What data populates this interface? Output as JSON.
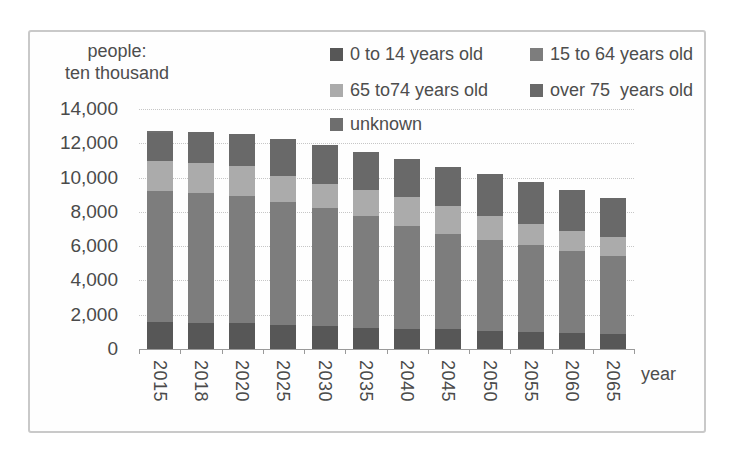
{
  "axis": {
    "y_title_line1": "people:",
    "y_title_line2": "ten thousand",
    "x_title": "year"
  },
  "chart_data": {
    "type": "bar",
    "stacked": true,
    "title": "",
    "ylabel": "people: ten thousand",
    "xlabel": "year",
    "ylim": [
      0,
      14000
    ],
    "ytick_interval": 2000,
    "ytick_labels": [
      "0",
      "2,000",
      "4,000",
      "6,000",
      "8,000",
      "10,000",
      "12,000",
      "14,000"
    ],
    "grid": true,
    "legend_position": "top",
    "categories": [
      "2015",
      "2018",
      "2020",
      "2025",
      "2030",
      "2035",
      "2040",
      "2045",
      "2050",
      "2055",
      "2060",
      "2065"
    ],
    "series": [
      {
        "name": "0 to 14 years old",
        "color": "#575757",
        "values": [
          1590,
          1540,
          1510,
          1410,
          1320,
          1250,
          1190,
          1140,
          1080,
          1010,
          950,
          900
        ]
      },
      {
        "name": "15 to 64 years old",
        "color": "#7d7d7d",
        "values": [
          7630,
          7550,
          7410,
          7170,
          6880,
          6490,
          5980,
          5580,
          5280,
          5030,
          4790,
          4530
        ]
      },
      {
        "name": "65 to74 years old",
        "color": "#ababab",
        "values": [
          1750,
          1760,
          1750,
          1500,
          1430,
          1520,
          1680,
          1640,
          1420,
          1260,
          1150,
          1130
        ]
      },
      {
        "name": "over 75  years old",
        "color": "#696969",
        "values": [
          1610,
          1800,
          1870,
          2180,
          2290,
          2260,
          2240,
          2280,
          2420,
          2450,
          2390,
          2250
        ]
      },
      {
        "name": "unknown",
        "color": "#6e6e6e",
        "values": [
          150,
          0,
          0,
          0,
          0,
          0,
          0,
          0,
          0,
          0,
          0,
          0
        ]
      }
    ],
    "totals": [
      12730,
      12650,
      12540,
      12260,
      11920,
      11520,
      11090,
      10640,
      10200,
      9750,
      9280,
      8810
    ]
  }
}
